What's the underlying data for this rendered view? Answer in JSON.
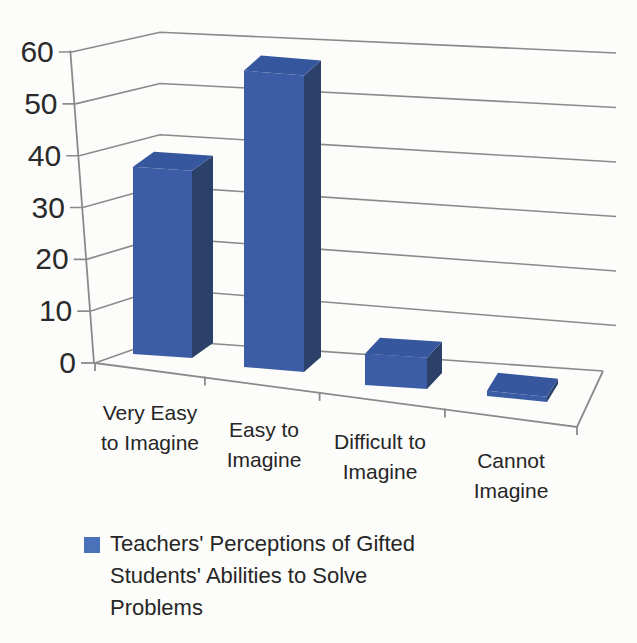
{
  "chart_data": {
    "type": "bar",
    "style": "3d-column",
    "title": "",
    "xlabel": "",
    "ylabel": "",
    "categories": [
      "Very Easy to Imagine",
      "Easy to Imagine",
      "Difficult to Imagine",
      "Cannot Imagine"
    ],
    "categories_wrapped": [
      [
        "Very Easy",
        "to Imagine"
      ],
      [
        "Easy to",
        "Imagine"
      ],
      [
        "Difficult to",
        "Imagine"
      ],
      [
        "Cannot",
        "Imagine"
      ]
    ],
    "values": [
      36,
      57,
      6,
      1
    ],
    "series_name": "Teachers' Perceptions of Gifted Students' Abilities to Solve Problems",
    "yticks": [
      0,
      10,
      20,
      30,
      40,
      50,
      60
    ],
    "ylim": [
      0,
      60
    ],
    "grid": true,
    "legend_position": "bottom-left",
    "colors": {
      "bar_front": "#3c5da6",
      "bar_top": "#36579e",
      "bar_side": "#2b4169",
      "legend_swatch": "#4a72b8",
      "gridline": "#8a8a8a",
      "text": "#262626",
      "background": "#fcfcfa"
    }
  }
}
